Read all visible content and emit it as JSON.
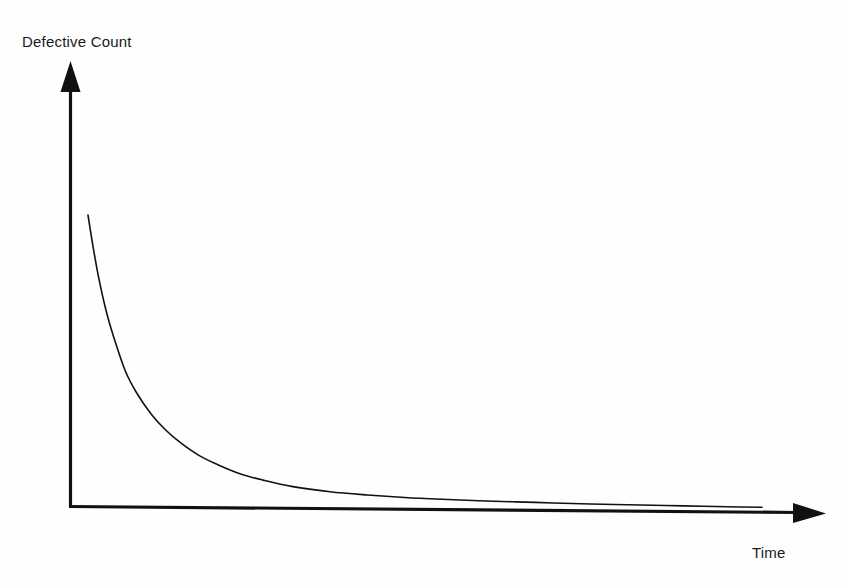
{
  "figure": {
    "background_color": "#fefefe",
    "ink_color": "#111111",
    "y_axis_label": "Defective Count",
    "x_axis_label": "Time"
  },
  "chart_data": {
    "type": "line",
    "title": "",
    "subtitle": "",
    "xlabel": "Time",
    "ylabel": "Defective Count",
    "grid": false,
    "legend": false,
    "legend_position": "none",
    "axes_style": "arrow-headed open axes, no tick marks, no tick labels",
    "xlim": [
      0,
      100
    ],
    "ylim": [
      0,
      100
    ],
    "xticks": [],
    "yticks": [],
    "xticklabels": [],
    "yticklabels": [],
    "annotations": [],
    "series": [
      {
        "name": "Defective Count",
        "color": "#111111",
        "line_width": 1.6,
        "description": "Monotonically decreasing exponential-decay style curve starting high near the y-axis and flattening asymptotically toward the time axis without touching it.",
        "x": [
          2.5,
          3.2,
          4.0,
          5.0,
          6.0,
          7.5,
          9.0,
          11.0,
          13.0,
          15.0,
          17.5,
          20.0,
          23.0,
          26.0,
          30.0,
          35.0,
          40.0,
          45.0,
          50.0,
          55.0,
          60.0,
          65.0,
          70.0,
          75.0,
          80.0,
          85.0,
          90.0,
          93.0
        ],
        "y": [
          82.0,
          73.0,
          64.0,
          55.0,
          48.0,
          39.0,
          33.0,
          27.0,
          22.5,
          19.0,
          15.5,
          13.0,
          10.5,
          8.8,
          7.0,
          5.6,
          4.7,
          4.0,
          3.5,
          3.1,
          2.8,
          2.5,
          2.2,
          2.0,
          1.8,
          1.6,
          1.4,
          1.3
        ]
      }
    ]
  },
  "geometry": {
    "origin_x": 70,
    "origin_y": 506,
    "y_axis_top": 62,
    "x_axis_right": 825,
    "curve_start_x": 88,
    "curve_start_y": 215,
    "curve_end_x": 762,
    "curve_end_y": 512
  }
}
